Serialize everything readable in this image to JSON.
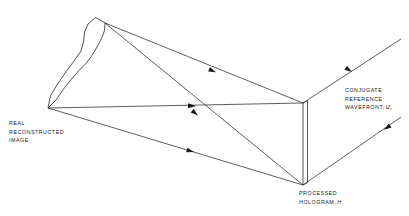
{
  "figure": {
    "type": "optical-ray-diagram",
    "title_visible": false,
    "background_color": "#ffffff",
    "line_color": "#1a1a1a",
    "width": 409,
    "height": 216
  },
  "labels": {
    "real_image": {
      "name": "real-reconstructed-image-label",
      "lines": [
        "REAL",
        "RECONSTRUCTED",
        "IMAGE"
      ]
    },
    "conjugate_reference": {
      "name": "conjugate-reference-wavefront-label",
      "lines": [
        "CONJUGATE",
        "REFERENCE"
      ],
      "third_line_prefix": "WAVEFRONT,",
      "symbol": "U",
      "symbol_prime": "′",
      "symbol_subscript": "r"
    },
    "processed_hologram": {
      "name": "processed-hologram-label",
      "lines": [
        "PROCESSED"
      ],
      "second_line_prefix": "HOLOGRAM,",
      "symbol": "H"
    }
  },
  "geometry": {
    "image_apex": [
      105,
      23
    ],
    "image_tip": [
      48,
      108
    ],
    "hologram_top": [
      303,
      103
    ],
    "hologram_bottom": [
      303,
      185
    ],
    "hologram_plate_offset": 4,
    "outgoing_upper_end": [
      401,
      39
    ],
    "outgoing_lower_end": [
      401,
      117
    ],
    "reconstructed_image_outline": "M 105,23 L 95,18 L 87,25 L 84,33 L 83,43 L 80,52 L 73,62 L 64,74 L 56,86 L 50,96 L 48,108 L 56,100 L 63,89 L 71,79 L 79,71 L 86,64 L 92,56 L 97,47 L 101,39 L 104,31 Z"
  },
  "rays": [
    {
      "name": "ray-hologram-top-to-image-apex",
      "from": [
        303,
        103
      ],
      "to": [
        105,
        23
      ],
      "arrow_at": [
        212,
        68
      ],
      "direction": "toward-image"
    },
    {
      "name": "ray-hologram-bottom-to-image-apex",
      "from": [
        303,
        185
      ],
      "to": [
        105,
        23
      ],
      "arrow_at": [
        194,
        113
      ],
      "direction": "toward-image"
    },
    {
      "name": "ray-hologram-top-to-image-tip",
      "from": [
        303,
        103
      ],
      "to": [
        48,
        108
      ],
      "arrow_at": [
        190,
        106
      ],
      "direction": "toward-image"
    },
    {
      "name": "ray-hologram-bottom-to-image-tip",
      "from": [
        303,
        185
      ],
      "to": [
        48,
        108
      ],
      "arrow_at": [
        190,
        152
      ],
      "direction": "toward-image"
    },
    {
      "name": "ray-outgoing-upper-conjugate",
      "from": [
        401,
        39
      ],
      "to": [
        303,
        103
      ],
      "arrow_at": [
        349,
        74
      ],
      "direction": "toward-hologram"
    },
    {
      "name": "ray-outgoing-lower-conjugate",
      "from": [
        303,
        185
      ],
      "to": [
        401,
        117
      ],
      "arrow_at": [
        381,
        132
      ],
      "direction": "away-from-hologram"
    }
  ]
}
